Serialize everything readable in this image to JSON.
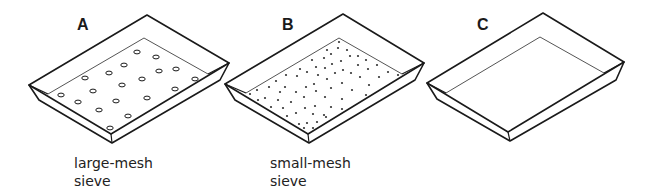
{
  "figure": {
    "trays": [
      {
        "id": "A",
        "label": "A",
        "caption_lines": [
          "large-mesh",
          "sieve"
        ],
        "type": "large-mesh sieve",
        "label_pos": [
          77,
          17
        ],
        "caption_pos": [
          74,
          154
        ],
        "rim": [
          [
            29,
            85
          ],
          [
            147,
            15
          ],
          [
            229,
            63
          ],
          [
            111,
            134
          ]
        ],
        "inner": [
          [
            48,
            94
          ],
          [
            144,
            38
          ],
          [
            208,
            74
          ],
          [
            111,
            134
          ]
        ],
        "outer_bottom": [
          [
            29,
            85
          ],
          [
            39,
            100
          ],
          [
            112,
            143
          ],
          [
            220,
            80
          ],
          [
            229,
            63
          ]
        ],
        "hole_size": "large",
        "holes": [
          [
            137,
            52
          ],
          [
            156,
            57
          ],
          [
            124,
            65
          ],
          [
            159,
            71
          ],
          [
            176,
            69
          ],
          [
            109,
            73
          ],
          [
            85,
            78
          ],
          [
            142,
            79
          ],
          [
            195,
            79
          ],
          [
            122,
            85
          ],
          [
            93,
            91
          ],
          [
            175,
            89
          ],
          [
            61,
            95
          ],
          [
            116,
            101
          ],
          [
            147,
            98
          ],
          [
            78,
            102
          ],
          [
            99,
            110
          ],
          [
            128,
            116
          ],
          [
            110,
            128
          ]
        ]
      },
      {
        "id": "B",
        "label": "B",
        "caption_lines": [
          "small-mesh",
          "sieve"
        ],
        "type": "small-mesh sieve",
        "label_pos": [
          282,
          17
        ],
        "caption_pos": [
          270,
          154
        ],
        "rim": [
          [
            225,
            84
          ],
          [
            343,
            14
          ],
          [
            424,
            63
          ],
          [
            308,
            134
          ]
        ],
        "inner": [
          [
            246,
            93
          ],
          [
            339,
            38
          ],
          [
            402,
            74
          ],
          [
            308,
            134
          ]
        ],
        "outer_bottom": [
          [
            225,
            84
          ],
          [
            235,
            100
          ],
          [
            309,
            143
          ],
          [
            415,
            80
          ],
          [
            424,
            63
          ]
        ],
        "hole_size": "small",
        "holes": [
          [
            339,
            42
          ],
          [
            327,
            50
          ],
          [
            338,
            48
          ],
          [
            347,
            50
          ],
          [
            331,
            54
          ],
          [
            324,
            58
          ],
          [
            350,
            56
          ],
          [
            358,
            56
          ],
          [
            341,
            61
          ],
          [
            312,
            60
          ],
          [
            332,
            64
          ],
          [
            366,
            60
          ],
          [
            358,
            65
          ],
          [
            316,
            67
          ],
          [
            325,
            68
          ],
          [
            300,
            69
          ],
          [
            343,
            70
          ],
          [
            377,
            65
          ],
          [
            368,
            69
          ],
          [
            307,
            72
          ],
          [
            335,
            73
          ],
          [
            351,
            73
          ],
          [
            286,
            75
          ],
          [
            388,
            72
          ],
          [
            297,
            76
          ],
          [
            318,
            75
          ],
          [
            379,
            77
          ],
          [
            398,
            75
          ],
          [
            327,
            79
          ],
          [
            360,
            77
          ],
          [
            276,
            81
          ],
          [
            314,
            84
          ],
          [
            342,
            83
          ],
          [
            285,
            87
          ],
          [
            269,
            87
          ],
          [
            306,
            87
          ],
          [
            331,
            88
          ],
          [
            369,
            85
          ],
          [
            352,
            90
          ],
          [
            257,
            90
          ],
          [
            250,
            94
          ],
          [
            296,
            92
          ],
          [
            316,
            91
          ],
          [
            280,
            92
          ],
          [
            325,
            97
          ],
          [
            265,
            98
          ],
          [
            304,
            97
          ],
          [
            342,
            99
          ],
          [
            366,
            95
          ],
          [
            278,
            100
          ],
          [
            291,
            102
          ],
          [
            315,
            106
          ],
          [
            258,
            100
          ],
          [
            271,
            107
          ],
          [
            283,
            108
          ],
          [
            331,
            107
          ],
          [
            305,
            108
          ],
          [
            296,
            113
          ],
          [
            324,
            115
          ],
          [
            287,
            116
          ],
          [
            313,
            114
          ],
          [
            342,
            109
          ],
          [
            307,
            123
          ],
          [
            299,
            124
          ],
          [
            317,
            122
          ],
          [
            326,
            117
          ],
          [
            304,
            128
          ],
          [
            313,
            128
          ]
        ]
      },
      {
        "id": "C",
        "label": "C",
        "caption_lines": [],
        "type": "solid tray",
        "label_pos": [
          477,
          17
        ],
        "caption_pos": [
          470,
          154
        ],
        "rim": [
          [
            427,
            83
          ],
          [
            543,
            13
          ],
          [
            624,
            62
          ],
          [
            508,
            132
          ]
        ],
        "inner": [
          [
            446,
            93
          ],
          [
            540,
            37
          ],
          [
            604,
            73
          ],
          [
            508,
            132
          ]
        ],
        "outer_bottom": [
          [
            427,
            83
          ],
          [
            437,
            99
          ],
          [
            510,
            141
          ],
          [
            616,
            80
          ],
          [
            624,
            62
          ]
        ],
        "hole_size": "none",
        "holes": []
      }
    ],
    "colors": {
      "stroke": "#1a1a1a",
      "inner_stroke": "#555555",
      "hole_fill": "#ffffff",
      "dot_fill": "#333333",
      "background": "#ffffff"
    }
  }
}
